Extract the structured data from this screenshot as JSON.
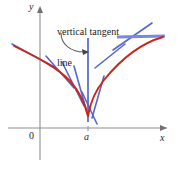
{
  "figure": {
    "annotation": {
      "line1": "vertical tangent",
      "line2": "line"
    },
    "axes": {
      "y_label": "y",
      "x_label": "x",
      "origin_label": "0",
      "point_label": "a"
    },
    "colors": {
      "curve": "#cc2418",
      "tangent": "#5566cc",
      "axis": "#8a8a8f",
      "text": "#1c1a1a"
    }
  },
  "chart_data": {
    "type": "line",
    "title": "vertical tangent line",
    "xlabel": "x",
    "ylabel": "y",
    "annotations": [
      "vertical tangent",
      "line"
    ],
    "tick_labels": {
      "x": [
        "0",
        "a"
      ],
      "y": []
    },
    "grid": false,
    "legend": "none",
    "curve": {
      "name": "f(x)",
      "color": "#cc2418",
      "points": [
        [
          14,
          46
        ],
        [
          24,
          51
        ],
        [
          34,
          56
        ],
        [
          44,
          61
        ],
        [
          54,
          67
        ],
        [
          62,
          73
        ],
        [
          70,
          81
        ],
        [
          76,
          89
        ],
        [
          81,
          97
        ],
        [
          85,
          106
        ],
        [
          87,
          113
        ],
        [
          88,
          116
        ],
        [
          90,
          112
        ],
        [
          93,
          102
        ],
        [
          97,
          92
        ],
        [
          102,
          82
        ],
        [
          108,
          73
        ],
        [
          116,
          63
        ],
        [
          126,
          53
        ],
        [
          136,
          45
        ],
        [
          148,
          40
        ],
        [
          160,
          37
        ]
      ]
    },
    "vertical_tangent": {
      "color": "#5566cc",
      "x": 88,
      "y_top": 38,
      "y_bottom": 122
    },
    "tangent_lines": [
      {
        "name": "left-far-tangent",
        "x1": 12,
        "y1": 44,
        "x2": 56,
        "y2": 68
      },
      {
        "name": "left-mid-tangent",
        "x1": 46,
        "y1": 56,
        "x2": 74,
        "y2": 88
      },
      {
        "name": "left-steep-tangent",
        "x1": 62,
        "y1": 62,
        "x2": 84,
        "y2": 106
      },
      {
        "name": "left-steeper-tangent",
        "x1": 74,
        "y1": 66,
        "x2": 88,
        "y2": 116
      },
      {
        "name": "cusp-cross-tangent",
        "x1": 82,
        "y1": 92,
        "x2": 97,
        "y2": 124
      },
      {
        "name": "right-steep-tangent",
        "x1": 92,
        "y1": 118,
        "x2": 104,
        "y2": 76
      },
      {
        "name": "right-mid-tangent",
        "x1": 95,
        "y1": 68,
        "x2": 125,
        "y2": 44
      },
      {
        "name": "right-slant-tangent",
        "x1": 113,
        "y1": 50,
        "x2": 152,
        "y2": 23
      },
      {
        "name": "right-horizontal-tangent",
        "x1": 117,
        "y1": 37,
        "x2": 165,
        "y2": 36
      }
    ],
    "pointer_arrow": {
      "from": [
        62,
        34
      ],
      "to": [
        88,
        52
      ]
    },
    "axis_ranges": {
      "x_axis_y": 128,
      "y_axis_x": 40
    }
  }
}
